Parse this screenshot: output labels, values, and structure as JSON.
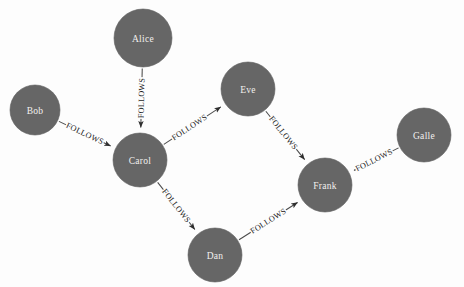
{
  "diagram": {
    "type": "directed-node-link-graph",
    "background_color": "#fdfdfd",
    "node_fill_color": "#666666",
    "node_label_color": "#f2f0ee",
    "edge_color": "#4a4a4a",
    "edge_label_color": "#1d1d1d",
    "canvas": {
      "width": 464,
      "height": 287
    },
    "nodes": [
      {
        "id": "alice",
        "label": "Alice",
        "cx": 143,
        "cy": 38,
        "r": 29
      },
      {
        "id": "bob",
        "label": "Bob",
        "cx": 35,
        "cy": 110,
        "r": 25
      },
      {
        "id": "eve",
        "label": "Eve",
        "cx": 248,
        "cy": 89,
        "r": 27
      },
      {
        "id": "carol",
        "label": "Carol",
        "cx": 140,
        "cy": 160,
        "r": 27
      },
      {
        "id": "galle",
        "label": "Galle",
        "cx": 424,
        "cy": 135,
        "r": 27
      },
      {
        "id": "frank",
        "label": "Frank",
        "cx": 325,
        "cy": 185,
        "r": 27
      },
      {
        "id": "dan",
        "label": "Dan",
        "cx": 215,
        "cy": 255,
        "r": 27
      }
    ],
    "edges": [
      {
        "id": "alice-carol",
        "source": "alice",
        "target": "carol",
        "label": "FOLLOWS",
        "label_t": 0.5
      },
      {
        "id": "bob-carol",
        "source": "bob",
        "target": "carol",
        "label": "FOLLOWS",
        "label_t": 0.5
      },
      {
        "id": "carol-eve",
        "source": "carol",
        "target": "eve",
        "label": "FOLLOWS",
        "label_t": 0.45
      },
      {
        "id": "eve-frank",
        "source": "eve",
        "target": "frank",
        "label": "FOLLOWS",
        "label_t": 0.45
      },
      {
        "id": "galle-frank",
        "source": "galle",
        "target": "frank",
        "label": "FOLLOWS",
        "label_t": 0.55
      },
      {
        "id": "carol-dan",
        "source": "carol",
        "target": "dan",
        "label": "FOLLOWS",
        "label_t": 0.5
      },
      {
        "id": "dan-frank",
        "source": "dan",
        "target": "frank",
        "label": "FOLLOWS",
        "label_t": 0.5
      }
    ]
  }
}
